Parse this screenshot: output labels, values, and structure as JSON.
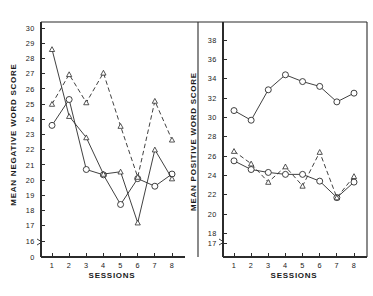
{
  "figure": {
    "background": "#ffffff",
    "ink_color": "#2b2b2b",
    "panels": 2
  },
  "left_panel": {
    "y_axis_title": "MEAN NEGATIVE WORD SCORE",
    "x_axis_title": "SESSIONS",
    "y_tick_labels": [
      "30",
      "29",
      "28",
      "27",
      "26",
      "25",
      "24",
      "23",
      "22",
      "21",
      "20",
      "19",
      "18",
      "17",
      "16",
      "0"
    ],
    "x_tick_labels": [
      "1",
      "2",
      "3",
      "4",
      "5",
      "6",
      "7",
      "8"
    ]
  },
  "right_panel": {
    "y_axis_title": "MEAN POSITIVE WORD SCORE",
    "x_axis_title": "SESSIONS",
    "y_tick_labels": [
      "38",
      "36",
      "34",
      "32",
      "30",
      "28",
      "26",
      "24",
      "22",
      "20",
      "18",
      "17"
    ],
    "x_tick_labels": [
      "1",
      "2",
      "3",
      "4",
      "5",
      "6",
      "7",
      "8"
    ]
  },
  "chart_data": [
    {
      "type": "line",
      "panel": "left",
      "title": "",
      "xlabel": "SESSIONS",
      "ylabel": "MEAN NEGATIVE WORD SCORE",
      "x": [
        1,
        2,
        3,
        4,
        5,
        6,
        7,
        8
      ],
      "xlim": [
        0.6,
        8.4
      ],
      "ylim": [
        16,
        30
      ],
      "grid": false,
      "legend": "none",
      "axis_break_at_zero": true,
      "series": [
        {
          "name": "series-a-solid-circle",
          "style": "solid",
          "marker": "circle-open",
          "values": [
            23.6,
            25.3,
            20.7,
            20.35,
            18.4,
            20.1,
            19.6,
            20.4
          ]
        },
        {
          "name": "series-b-solid-triangle",
          "style": "solid",
          "marker": "triangle-open",
          "values": [
            28.6,
            24.2,
            22.8,
            20.4,
            20.55,
            17.2,
            22.0,
            20.1
          ]
        },
        {
          "name": "series-c-dashed-triangle",
          "style": "dashed",
          "marker": "triangle-open",
          "values": [
            25.0,
            26.95,
            25.1,
            27.05,
            23.55,
            20.2,
            25.2,
            22.65
          ]
        }
      ]
    },
    {
      "type": "line",
      "panel": "right",
      "title": "",
      "xlabel": "SESSIONS",
      "ylabel": "MEAN POSITIVE WORD SCORE",
      "x": [
        1,
        2,
        3,
        4,
        5,
        6,
        7,
        8
      ],
      "xlim": [
        0.6,
        8.4
      ],
      "ylim": [
        17,
        38
      ],
      "grid": false,
      "legend": "none",
      "axis_break_at_zero": true,
      "series": [
        {
          "name": "series-d-solid-circle-high",
          "style": "solid",
          "marker": "circle-open",
          "values": [
            30.7,
            29.7,
            32.85,
            34.4,
            33.7,
            33.2,
            31.6,
            32.5
          ]
        },
        {
          "name": "series-e-solid-circle-low",
          "style": "solid",
          "marker": "circle-open",
          "values": [
            25.5,
            24.6,
            24.3,
            24.1,
            24.1,
            23.4,
            21.7,
            23.3
          ]
        },
        {
          "name": "series-f-dashed-triangle",
          "style": "dashed",
          "marker": "triangle-open",
          "values": [
            26.5,
            25.2,
            23.3,
            24.9,
            22.9,
            26.4,
            21.7,
            23.9
          ]
        }
      ]
    }
  ]
}
